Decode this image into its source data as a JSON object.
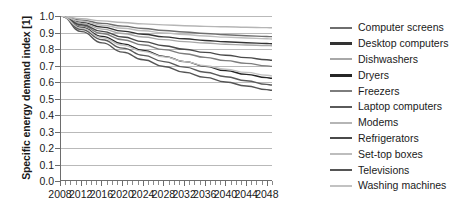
{
  "chart_data": {
    "type": "line",
    "title": "",
    "xlabel": "",
    "ylabel": "Specific energy demand index [1]",
    "xlim": [
      2008,
      2049
    ],
    "ylim": [
      0.0,
      1.0
    ],
    "grid": "horizontal",
    "legend_position": "right",
    "y_ticks": [
      "1.0",
      "0.9",
      "0.8",
      "0.7",
      "0.6",
      "0.5",
      "0.4",
      "0.3",
      "0.2",
      "0.1",
      "0.0"
    ],
    "y_tick_values": [
      1.0,
      0.9,
      0.8,
      0.7,
      0.6,
      0.5,
      0.4,
      0.3,
      0.2,
      0.1,
      0.0
    ],
    "x_ticks": [
      "2008",
      "2012",
      "2016",
      "2020",
      "2024",
      "2028",
      "2032",
      "2036",
      "2040",
      "2044",
      "2048"
    ],
    "x_tick_values": [
      2008,
      2012,
      2016,
      2020,
      2024,
      2028,
      2032,
      2036,
      2040,
      2044,
      2048
    ],
    "x_minor_tick_step": 1,
    "x": [
      2008,
      2012,
      2016,
      2020,
      2024,
      2028,
      2032,
      2036,
      2040,
      2044,
      2048,
      2049
    ],
    "series": [
      {
        "name": "Computer screens",
        "color": "#6e6e6e",
        "values": [
          1.0,
          0.975,
          0.955,
          0.938,
          0.924,
          0.912,
          0.902,
          0.893,
          0.886,
          0.88,
          0.875,
          0.874
        ]
      },
      {
        "name": "Desktop computers",
        "color": "#333333",
        "values": [
          1.0,
          0.962,
          0.932,
          0.908,
          0.889,
          0.873,
          0.861,
          0.851,
          0.843,
          0.837,
          0.832,
          0.831
        ]
      },
      {
        "name": "Dishwashers",
        "color": "#a8a8a8",
        "values": [
          1.0,
          0.955,
          0.92,
          0.893,
          0.872,
          0.856,
          0.844,
          0.835,
          0.828,
          0.823,
          0.82,
          0.819
        ]
      },
      {
        "name": "Dryers",
        "color": "#262626",
        "values": [
          1.0,
          0.93,
          0.876,
          0.83,
          0.79,
          0.754,
          0.722,
          0.693,
          0.667,
          0.644,
          0.624,
          0.62
        ]
      },
      {
        "name": "Freezers",
        "color": "#7d7d7d",
        "values": [
          1.0,
          0.94,
          0.893,
          0.855,
          0.823,
          0.795,
          0.77,
          0.748,
          0.728,
          0.711,
          0.696,
          0.693
        ]
      },
      {
        "name": "Laptop computers",
        "color": "#5a5a5a",
        "values": [
          1.0,
          0.918,
          0.855,
          0.804,
          0.76,
          0.722,
          0.688,
          0.657,
          0.63,
          0.605,
          0.583,
          0.579
        ]
      },
      {
        "name": "Modems",
        "color": "#b5b5b5",
        "values": [
          1.0,
          0.983,
          0.97,
          0.96,
          0.952,
          0.946,
          0.941,
          0.937,
          0.934,
          0.931,
          0.929,
          0.928
        ]
      },
      {
        "name": "Refrigerators",
        "color": "#4a4a4a",
        "values": [
          1.0,
          0.947,
          0.906,
          0.872,
          0.844,
          0.819,
          0.797,
          0.778,
          0.761,
          0.746,
          0.733,
          0.73
        ]
      },
      {
        "name": "Set-top boxes",
        "color": "#bdbdbd",
        "values": [
          1.0,
          0.968,
          0.944,
          0.925,
          0.91,
          0.897,
          0.887,
          0.878,
          0.871,
          0.866,
          0.861,
          0.86
        ]
      },
      {
        "name": "Televisions",
        "color": "#555555",
        "values": [
          1.0,
          0.905,
          0.836,
          0.78,
          0.733,
          0.692,
          0.657,
          0.626,
          0.598,
          0.573,
          0.551,
          0.547
        ]
      },
      {
        "name": "Washing machines",
        "color": "#c2c2c2",
        "values": [
          1.0,
          0.925,
          0.868,
          0.822,
          0.784,
          0.751,
          0.722,
          0.697,
          0.675,
          0.656,
          0.639,
          0.635
        ]
      }
    ]
  }
}
